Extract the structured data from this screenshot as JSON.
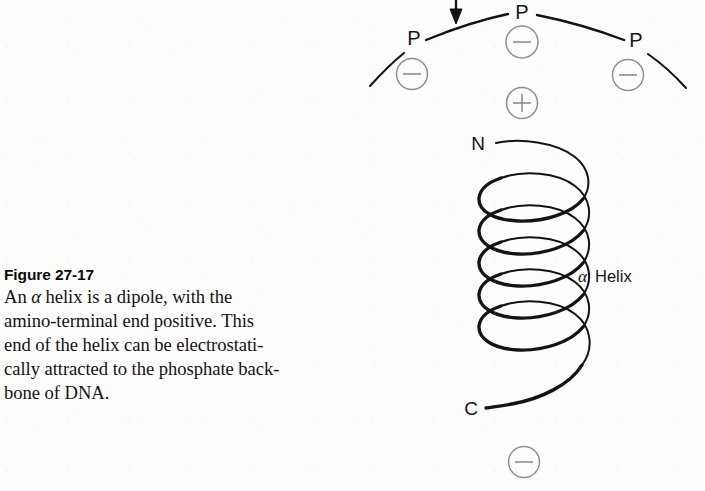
{
  "figure": {
    "caption_title": "Figure 27-17",
    "caption_body": "An α helix is a dipole, with the amino-terminal end positive. This end of the helix can be electrostatically attracted to the phosphate backbone of DNA.",
    "caption_body_lines": [
      "An α helix is a dipole, with the",
      "amino-terminal end positive. This",
      "end of the helix can be electrostati-",
      "cally attracted to the phosphate back-",
      "bone of DNA."
    ]
  },
  "diagram": {
    "backbone": {
      "name": "DNA phosphate backbone",
      "phosphate_labels": [
        "P",
        "P",
        "P"
      ],
      "phosphate_positions": [
        {
          "label": "P",
          "x": 414,
          "y": 45
        },
        {
          "label": "P",
          "x": 522,
          "y": 19
        },
        {
          "label": "P",
          "x": 636,
          "y": 47
        }
      ]
    },
    "charges": [
      {
        "sign": "−",
        "x": 412,
        "y": 74,
        "role": "phosphate-negative-left"
      },
      {
        "sign": "−",
        "x": 522,
        "y": 42,
        "role": "phosphate-negative-center"
      },
      {
        "sign": "−",
        "x": 628,
        "y": 75,
        "role": "phosphate-negative-right"
      },
      {
        "sign": "+",
        "x": 522,
        "y": 103,
        "role": "helix-amino-terminal-positive"
      },
      {
        "sign": "−",
        "x": 524,
        "y": 462,
        "role": "helix-carboxyl-terminal-negative"
      }
    ],
    "helix": {
      "label": "α Helix",
      "label_alpha": "α",
      "label_word": "Helix",
      "terminus_n": "N",
      "terminus_c": "C",
      "turns": 5
    },
    "annotation": {
      "arrow": "down-arrow-attraction-pointer"
    }
  },
  "colors": {
    "ink": "#141414",
    "charge_gray": "#8e8e8e",
    "page": "#fdfdfc"
  }
}
